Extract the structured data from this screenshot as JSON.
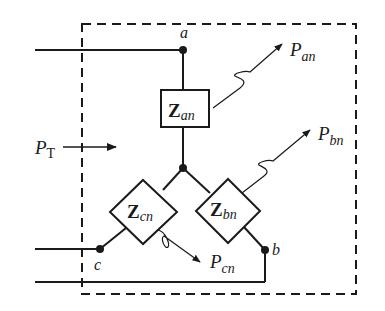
{
  "diagram": {
    "colors": {
      "stroke": "#1a1a1a",
      "background": "#ffffff"
    },
    "nodes": {
      "a": {
        "label": "a"
      },
      "b": {
        "label": "b"
      },
      "c": {
        "label": "c"
      }
    },
    "impedances": {
      "an": {
        "symbol": "Z",
        "subscript": "an"
      },
      "bn": {
        "symbol": "Z",
        "subscript": "bn"
      },
      "cn": {
        "symbol": "Z",
        "subscript": "cn"
      }
    },
    "powers": {
      "total": {
        "symbol": "P",
        "subscript": "T"
      },
      "an": {
        "symbol": "P",
        "subscript": "an"
      },
      "bn": {
        "symbol": "P",
        "subscript": "bn"
      },
      "cn": {
        "symbol": "P",
        "subscript": "cn"
      }
    }
  }
}
